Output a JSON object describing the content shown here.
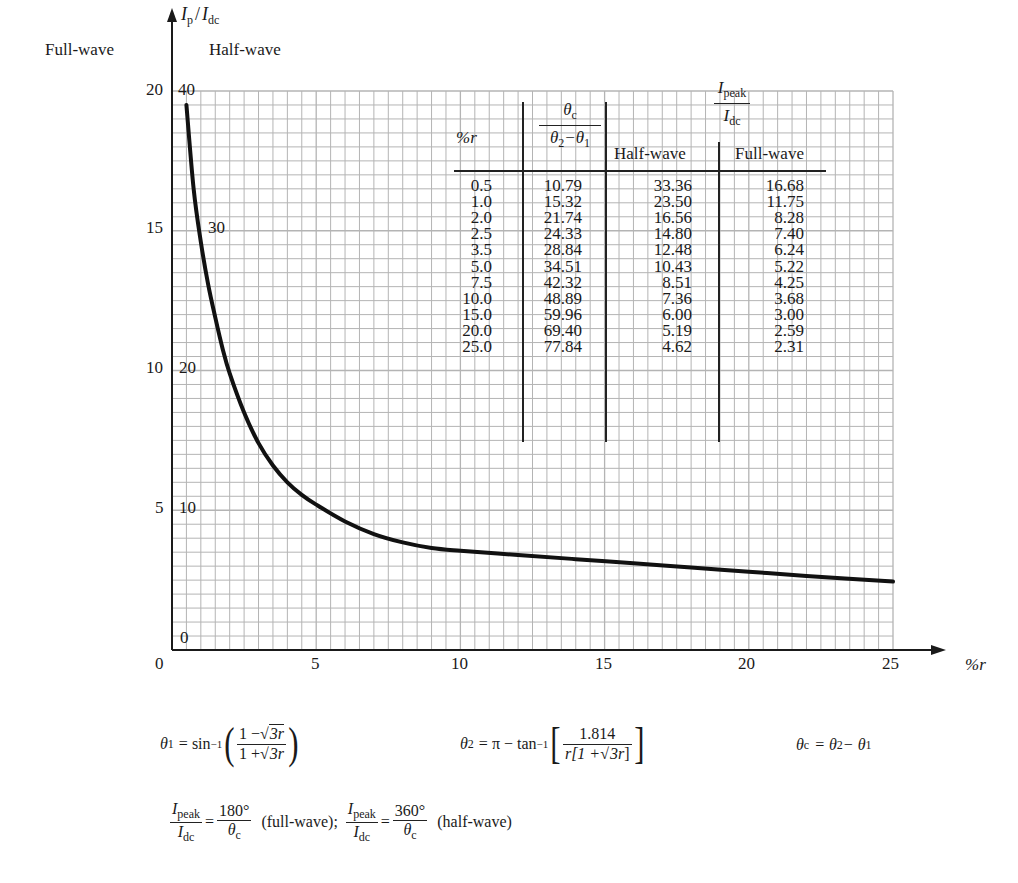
{
  "chart_data": {
    "type": "line",
    "title": "",
    "ylabel": "I_p / I_dc",
    "xlabel": "%r",
    "xlim": [
      0,
      25
    ],
    "ylim_full_wave": [
      0,
      20
    ],
    "ylim_half_wave": [
      0,
      40
    ],
    "grid": true,
    "x_ticks": [
      "0",
      "5",
      "10",
      "15",
      "20",
      "25"
    ],
    "y_ticks_full_wave": [
      "0",
      "5",
      "10",
      "15",
      "20"
    ],
    "y_ticks_half_wave": [
      "0",
      "10",
      "20",
      "30",
      "40"
    ],
    "axis_headers": {
      "full_wave": "Full-wave",
      "half_wave": "Half-wave"
    },
    "series": [
      {
        "name": "I_peak/I_dc (full-wave scale left, half-wave scale right)",
        "x": [
          0.5,
          1.0,
          2.0,
          2.5,
          3.5,
          5.0,
          7.5,
          10.0,
          15.0,
          20.0,
          25.0
        ],
        "full_wave": [
          16.68,
          11.75,
          8.28,
          7.4,
          6.24,
          5.22,
          4.25,
          3.68,
          3.0,
          2.59,
          2.31
        ],
        "half_wave": [
          33.36,
          23.5,
          16.56,
          14.8,
          12.48,
          10.43,
          8.51,
          7.36,
          6.0,
          5.19,
          4.62
        ]
      }
    ],
    "curve_plot_points": [
      [
        0.5,
        19.5
      ],
      [
        0.75,
        16.5
      ],
      [
        1.0,
        14.6
      ],
      [
        1.25,
        13.1
      ],
      [
        1.5,
        11.9
      ],
      [
        1.75,
        10.8
      ],
      [
        2.0,
        9.9
      ],
      [
        2.5,
        8.5
      ],
      [
        3.0,
        7.4
      ],
      [
        3.5,
        6.6
      ],
      [
        4.0,
        6.0
      ],
      [
        4.5,
        5.55
      ],
      [
        5.0,
        5.2
      ],
      [
        6.0,
        4.6
      ],
      [
        7.0,
        4.15
      ],
      [
        8.0,
        3.85
      ],
      [
        9.0,
        3.65
      ],
      [
        10.0,
        3.55
      ],
      [
        12.0,
        3.4
      ],
      [
        14.0,
        3.25
      ],
      [
        16.0,
        3.1
      ],
      [
        18.0,
        2.95
      ],
      [
        20.0,
        2.8
      ],
      [
        22.0,
        2.65
      ],
      [
        25.0,
        2.45
      ]
    ]
  },
  "axes": {
    "y_label_main": "I",
    "y_label_sub_p": "p",
    "y_label_sep": "/",
    "y_label_den": "I",
    "y_label_sub_dc": "dc",
    "x_label": "%r",
    "full_wave_header": "Full-wave",
    "half_wave_header": "Half-wave",
    "x_ticks": [
      {
        "label": "0",
        "value": 0
      },
      {
        "label": "5",
        "value": 5
      },
      {
        "label": "10",
        "value": 10
      },
      {
        "label": "15",
        "value": 15
      },
      {
        "label": "20",
        "value": 20
      },
      {
        "label": "25",
        "value": 25
      }
    ],
    "y_ticks": [
      {
        "full": "20",
        "half": "40",
        "value": 20
      },
      {
        "full": "15",
        "half": "30",
        "value": 15
      },
      {
        "full": "10",
        "half": "20",
        "value": 10
      },
      {
        "full": "5",
        "half": "10",
        "value": 5
      },
      {
        "full": "",
        "half": "0",
        "value": 0
      }
    ]
  },
  "table": {
    "headers": {
      "r": "%r",
      "theta_num": "θ",
      "theta_num_sub": "c",
      "theta_den": "θ",
      "theta_den_sub1": "2",
      "theta_den_minus": "−θ",
      "theta_den_sub2": "1",
      "ipeak": "I",
      "ipeak_sub": "peak",
      "idc": "I",
      "idc_sub": "dc",
      "half_wave": "Half-wave",
      "full_wave": "Full-wave"
    },
    "rows": [
      {
        "r": "0.5",
        "theta": "10.79",
        "half": "33.36",
        "full": "16.68"
      },
      {
        "r": "1.0",
        "theta": "15.32",
        "half": "23.50",
        "full": "11.75"
      },
      {
        "r": "2.0",
        "theta": "21.74",
        "half": "16.56",
        "full": "8.28"
      },
      {
        "r": "2.5",
        "theta": "24.33",
        "half": "14.80",
        "full": "7.40"
      },
      {
        "r": "3.5",
        "theta": "28.84",
        "half": "12.48",
        "full": "6.24"
      },
      {
        "r": "5.0",
        "theta": "34.51",
        "half": "10.43",
        "full": "5.22"
      },
      {
        "r": "7.5",
        "theta": "42.32",
        "half": "8.51",
        "full": "4.25"
      },
      {
        "r": "10.0",
        "theta": "48.89",
        "half": "7.36",
        "full": "3.68"
      },
      {
        "r": "15.0",
        "theta": "59.96",
        "half": "6.00",
        "full": "3.00"
      },
      {
        "r": "20.0",
        "theta": "69.40",
        "half": "5.19",
        "full": "2.59"
      },
      {
        "r": "25.0",
        "theta": "77.84",
        "half": "4.62",
        "full": "2.31"
      }
    ]
  },
  "formulas": {
    "theta1_lhs": "θ",
    "theta1_sub": "1",
    "theta1_eq": "= sin",
    "theta1_sup": "−1",
    "theta1_num_a": "1 −",
    "theta1_num_sqrt": "3r",
    "theta1_den_a": "1 +",
    "theta1_den_sqrt": "3r",
    "theta2_lhs": "θ",
    "theta2_sub": "2",
    "theta2_eq": "= π − tan",
    "theta2_sup": "−1",
    "theta2_num": "1.814",
    "theta2_den_a": "r[1 +",
    "theta2_den_sqrt": "3r",
    "theta2_den_b": "]",
    "thetac_lhs": "θ",
    "thetac_sub": "c",
    "thetac_eq": "= θ",
    "thetac_sub2": "2",
    "thetac_minus": " − θ",
    "thetac_sub1": "1",
    "ratio_num": "I",
    "ratio_num_sub": "peak",
    "ratio_den": "I",
    "ratio_den_sub": "dc",
    "full_rhs_num": "180°",
    "full_rhs_den": "θ",
    "full_rhs_den_sub": "c",
    "full_note": "(full-wave);",
    "half_rhs_num": "360°",
    "half_rhs_den": "θ",
    "half_rhs_den_sub": "c",
    "half_note": "(half-wave)"
  },
  "colors": {
    "grid": "#b4b4b4",
    "curve": "#111111",
    "axis": "#1a1a1a",
    "text": "#1a1a1a"
  }
}
